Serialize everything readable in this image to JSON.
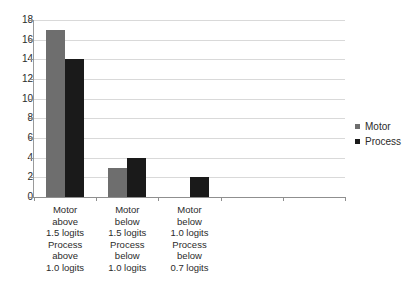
{
  "chart_data": {
    "type": "bar",
    "title": "",
    "xlabel": "",
    "ylabel": "",
    "ylim": [
      0,
      18
    ],
    "ytick_step": 2,
    "yticks": [
      "18",
      "16",
      "14",
      "12",
      "10",
      "8",
      "6",
      "4",
      "2",
      "0"
    ],
    "grid": true,
    "legend_position": "right",
    "category_slots": 5,
    "categories": [
      "Motor\nabove\n1.5 logits\nProcess\nabove\n1.0 logits",
      "Motor\nbelow\n1.5 logits\nProcess\nbelow\n1.0 logits",
      "Motor\nbelow\n1.0 logits\nProcess\nbelow\n0.7 logits",
      "",
      ""
    ],
    "series": [
      {
        "name": "Motor",
        "color": "#6e6e6e",
        "values": [
          17,
          3,
          0,
          0,
          0
        ]
      },
      {
        "name": "Process",
        "color": "#1a1a1a",
        "values": [
          14,
          4,
          2,
          0,
          0
        ]
      }
    ]
  },
  "legend": {
    "items": [
      {
        "label": "Motor",
        "color": "#6e6e6e"
      },
      {
        "label": "Process",
        "color": "#1a1a1a"
      }
    ]
  }
}
